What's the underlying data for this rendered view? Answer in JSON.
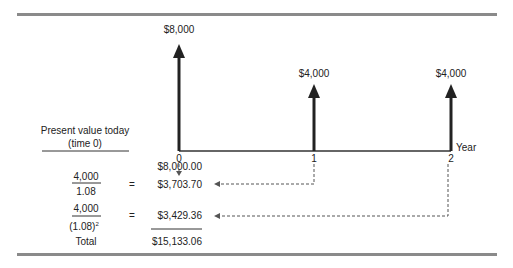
{
  "diagram": {
    "cash_flows": [
      {
        "year": "0",
        "amount": "$8,000"
      },
      {
        "year": "1",
        "amount": "$4,000"
      },
      {
        "year": "2",
        "amount": "$4,000"
      }
    ],
    "axis_label": "Year",
    "pv_heading_line1": "Present value today",
    "pv_heading_line2": "(time 0)",
    "rows": [
      {
        "numerator": "",
        "denominator": "",
        "equals": "",
        "value": "$8,000.00"
      },
      {
        "numerator": "4,000",
        "denominator": "1.08",
        "equals": "=",
        "value": "$3,703.70"
      },
      {
        "numerator": "4,000",
        "denominator": "(1.08)",
        "exponent": "2",
        "equals": "=",
        "value": "$3,429.36"
      }
    ],
    "total_label": "Total",
    "total_value": "$15,133.06"
  }
}
